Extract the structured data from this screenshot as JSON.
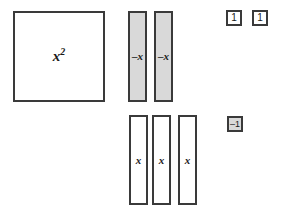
{
  "diagram": {
    "colors": {
      "border": "#3a3a3a",
      "shaded_fill": "#d9d9d9",
      "unshaded_fill": "#ffffff",
      "text": "#1a1a1a",
      "background": "#ffffff"
    },
    "tiles": [
      {
        "id": "x-squared",
        "label_base": "x",
        "label_exponent": "2",
        "sign": "positive",
        "shaded": false,
        "shape": "large-square"
      },
      {
        "id": "negative-x-1",
        "label": "–x",
        "sign": "negative",
        "shaded": true,
        "shape": "tall-rectangle"
      },
      {
        "id": "negative-x-2",
        "label": "–x",
        "sign": "negative",
        "shaded": true,
        "shape": "tall-rectangle"
      },
      {
        "id": "positive-x-1",
        "label": "x",
        "sign": "positive",
        "shaded": false,
        "shape": "tall-rectangle"
      },
      {
        "id": "positive-x-2",
        "label": "x",
        "sign": "positive",
        "shaded": false,
        "shape": "tall-rectangle"
      },
      {
        "id": "positive-x-3",
        "label": "x",
        "sign": "positive",
        "shaded": false,
        "shape": "tall-rectangle"
      },
      {
        "id": "unit-one-1",
        "label": "1",
        "sign": "positive",
        "shaded": false,
        "shape": "small-square"
      },
      {
        "id": "unit-one-2",
        "label": "1",
        "sign": "positive",
        "shaded": false,
        "shape": "small-square"
      },
      {
        "id": "unit-negative-one",
        "label": "–1",
        "sign": "negative",
        "shaded": true,
        "shape": "small-square"
      }
    ]
  }
}
